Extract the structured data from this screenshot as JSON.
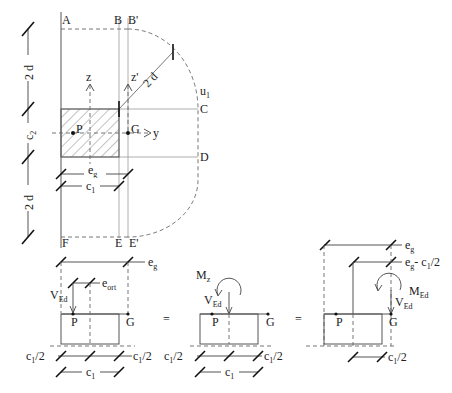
{
  "figure": {
    "top_view": {
      "corner_labels": [
        "A",
        "B",
        "B'",
        "C",
        "D",
        "E",
        "E'",
        "F"
      ],
      "perimeter_label": "u",
      "perimeter_sub": "1",
      "radius_label": "2 d",
      "axis_z": "z",
      "axis_z_prime": "z'",
      "axis_y": "y",
      "point_p": "P",
      "point_g": "G",
      "dim_eg": "e",
      "dim_eg_sub": "g",
      "dim_c1": "c",
      "dim_c1_sub": "1",
      "left_dims": [
        {
          "label": "2 d"
        },
        {
          "label": "c",
          "sub": "2"
        },
        {
          "label": "2 d"
        }
      ]
    },
    "bottom_views": [
      {
        "name": "original",
        "load_label": "V",
        "load_sub": "Ed",
        "eg_label": "e",
        "eg_sub": "g",
        "eort_label": "e",
        "eort_sub": "ort",
        "p": "P",
        "g": "G",
        "half_left": "c",
        "half_left_sub": "1",
        "half_left_suffix": "/2",
        "half_right": "c",
        "half_right_sub": "1",
        "half_right_suffix": "/2",
        "c1": "c",
        "c1_sub": "1"
      },
      {
        "name": "centered-with-moment",
        "equals": "=",
        "moment_label": "M",
        "moment_sub": "z",
        "load_label": "V",
        "load_sub": "Ed",
        "p": "P",
        "g": "G",
        "half_left": "c",
        "half_left_sub": "1",
        "half_left_suffix": "/2",
        "half_right": "c",
        "half_right_sub": "1",
        "half_right_suffix": "/2",
        "c1": "c",
        "c1_sub": "1"
      },
      {
        "name": "transferred-to-G",
        "equals": "=",
        "eg_label": "e",
        "eg_sub": "g",
        "eg2_label": "e",
        "eg2_sub": "g",
        "eg2_suffix": "- c",
        "eg2_suffix_sub": "1",
        "eg2_tail": "/2",
        "moment_label": "M",
        "moment_sub": "Ed",
        "load_label": "V",
        "load_sub": "Ed",
        "p": "P",
        "g": "G",
        "half_right": "c",
        "half_right_sub": "1",
        "half_right_suffix": "/2"
      }
    ]
  }
}
